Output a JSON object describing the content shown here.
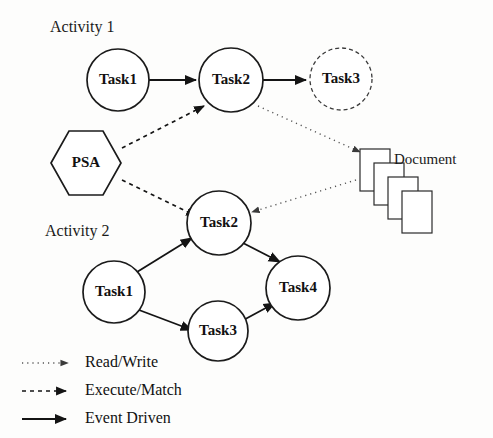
{
  "figure": {
    "background_color": "#fdfdfc",
    "ink_color": "#141414"
  },
  "activities": [
    {
      "label": "Activity 1"
    },
    {
      "label": "Activity 2"
    }
  ],
  "nodes": {
    "a1_task1": "Task1",
    "a1_task2": "Task2",
    "a1_task3": "Task3",
    "psa": "PSA",
    "a2_task2": "Task2",
    "a2_task1": "Task1",
    "a2_task3": "Task3",
    "a2_task4": "Task4"
  },
  "document": {
    "label": "Document"
  },
  "legend": {
    "items": [
      {
        "label": "Read/Write",
        "style": "dotted"
      },
      {
        "label": "Execute/Match",
        "style": "dashed"
      },
      {
        "label": "Event Driven",
        "style": "solid"
      }
    ]
  },
  "edges": [
    {
      "from": "a1_task1",
      "to": "a1_task2",
      "style": "solid"
    },
    {
      "from": "a1_task2",
      "to": "a1_task3",
      "style": "solid"
    },
    {
      "from": "psa",
      "to": "a1_task2",
      "style": "dashed"
    },
    {
      "from": "psa",
      "to": "a2_task2",
      "style": "dashed"
    },
    {
      "from": "a1_task2",
      "to": "document",
      "style": "dotted"
    },
    {
      "from": "document",
      "to": "a2_task2",
      "style": "dotted"
    },
    {
      "from": "a2_task1",
      "to": "a2_task2",
      "style": "solid"
    },
    {
      "from": "a2_task1",
      "to": "a2_task3",
      "style": "solid"
    },
    {
      "from": "a2_task2",
      "to": "a2_task4",
      "style": "solid"
    },
    {
      "from": "a2_task3",
      "to": "a2_task4",
      "style": "solid"
    }
  ]
}
